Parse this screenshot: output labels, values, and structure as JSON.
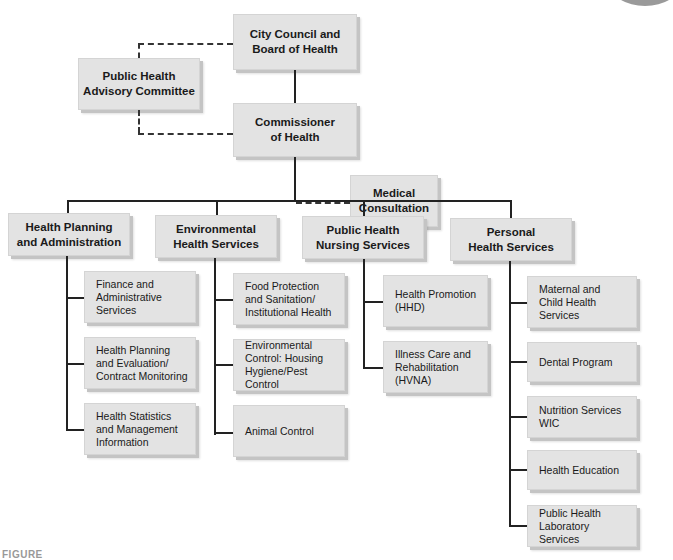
{
  "chart": {
    "top": {
      "label": "City Council and\nBoard of Health"
    },
    "advisory": {
      "label": "Public Health\nAdvisory Committee"
    },
    "commissioner": {
      "label": "Commissioner\nof Health"
    },
    "medical": {
      "label": "Medical\nConsultation"
    },
    "divisions": [
      {
        "label": "Health Planning\nand Administration",
        "units": [
          "Finance and\nAdministrative\nServices",
          "Health Planning\nand Evaluation/\nContract Monitoring",
          "Health Statistics\nand Management\nInformation"
        ]
      },
      {
        "label": "Environmental\nHealth Services",
        "units": [
          "Food Protection\nand Sanitation/\nInstitutional Health",
          "Environmental\nControl: Housing\nHygiene/Pest Control",
          "Animal Control"
        ]
      },
      {
        "label": "Public Health\nNursing Services",
        "units": [
          "Health Promotion\n(HHD)",
          "Illness Care and\nRehabilitation\n(HVNA)"
        ]
      },
      {
        "label": "Personal\nHealth Services",
        "units": [
          "Maternal and\nChild Health\nServices",
          "Dental Program",
          "Nutrition Services\nWIC",
          "Health Education",
          "Public Health\nLaboratory Services"
        ]
      }
    ]
  },
  "caption": "FIGURE"
}
